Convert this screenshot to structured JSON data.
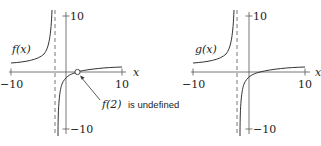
{
  "plots": [
    {
      "id": "f",
      "function_label": "f(x)",
      "function_name": "f",
      "x_axis_label": "x",
      "x_min_label": "−10",
      "x_max_label": "10",
      "y_max_label": "10",
      "y_min_label": "−10",
      "vertical_asymptote_x": -2,
      "horizontal_asymptote_y": 1,
      "hole": {
        "x": 2,
        "y": 0
      },
      "annotation": "f(2) is undefined",
      "annotation_name": "f(2)",
      "annotation_rest": " is undefined"
    },
    {
      "id": "g",
      "function_label": "g(x)",
      "function_name": "g",
      "x_axis_label": "x",
      "x_min_label": "−10",
      "x_max_label": "10",
      "y_max_label": "10",
      "y_min_label": "−10",
      "vertical_asymptote_x": -2,
      "horizontal_asymptote_y": 1
    }
  ],
  "colors": {
    "curve": "#333333",
    "axis": "#555555",
    "asymptote": "#555555"
  }
}
